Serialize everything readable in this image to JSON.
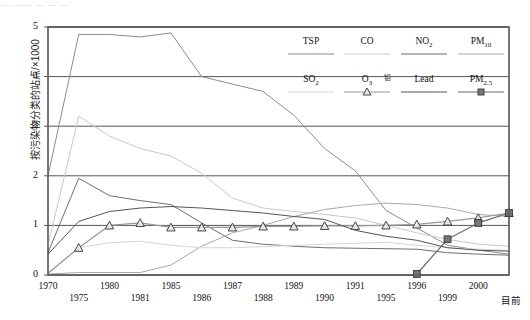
{
  "page": {
    "faint_header": "— —— — —  —",
    "axis_end_label": "目前"
  },
  "chart_data": {
    "type": "line",
    "title": "",
    "xlabel": "",
    "ylabel": "按污染物分类的站点/×1000",
    "ylim": [
      0,
      5
    ],
    "yticks": [
      "0",
      "1",
      "2",
      "3",
      "4",
      "5"
    ],
    "grid": true,
    "legend_position": "top-right",
    "categories": [
      "1970",
      "1975",
      "1980",
      "1981",
      "1985",
      "1986",
      "1987",
      "1988",
      "1989",
      "1990",
      "1991",
      "1995",
      "1996",
      "1999",
      "2000",
      "目前"
    ],
    "series": [
      {
        "name": "TSP",
        "color": "#8c8c8c",
        "marker": "none",
        "values": [
          2.0,
          4.85,
          4.85,
          4.8,
          4.88,
          4.0,
          3.85,
          3.7,
          3.22,
          2.55,
          2.1,
          1.3,
          0.95,
          0.6,
          0.5,
          0.42
        ]
      },
      {
        "name": "CO",
        "color": "#c9c9c9",
        "marker": "none",
        "values": [
          0.6,
          3.2,
          2.8,
          2.55,
          2.4,
          2.05,
          1.55,
          1.35,
          1.28,
          1.22,
          1.15,
          1.0,
          0.85,
          0.72,
          0.62,
          0.58
        ]
      },
      {
        "name": "NO2",
        "color": "#6e6e6e",
        "marker": "none",
        "values": [
          0.45,
          1.95,
          1.6,
          1.5,
          1.42,
          1.05,
          0.7,
          0.62,
          0.58,
          0.55,
          0.54,
          0.53,
          0.52,
          0.45,
          0.42,
          0.4
        ]
      },
      {
        "name": "PM10",
        "color": "#a8a8a8",
        "marker": "none",
        "values": [
          0.02,
          0.05,
          0.05,
          0.05,
          0.2,
          0.58,
          0.85,
          1.0,
          1.18,
          1.32,
          1.4,
          1.45,
          1.42,
          1.35,
          1.22,
          1.18
        ]
      },
      {
        "name": "SO2",
        "color": "#d6d6d6",
        "marker": "none",
        "values": [
          0.05,
          0.55,
          0.65,
          0.68,
          0.6,
          0.55,
          0.55,
          0.57,
          0.6,
          0.62,
          0.64,
          0.66,
          0.6,
          0.55,
          0.52,
          0.5
        ]
      },
      {
        "name": "O3",
        "color": "#9a9a9a",
        "marker": "triangle",
        "values": [
          0.03,
          0.55,
          1.0,
          1.05,
          0.96,
          0.96,
          0.96,
          0.98,
          0.98,
          0.99,
          0.99,
          1.0,
          1.02,
          1.08,
          1.15,
          1.25
        ]
      },
      {
        "name": "Lead",
        "cn_name": "铅",
        "color": "#555555",
        "marker": "none",
        "values": [
          0.42,
          1.08,
          1.28,
          1.35,
          1.38,
          1.35,
          1.3,
          1.25,
          1.18,
          1.12,
          0.9,
          0.78,
          0.7,
          0.55,
          0.5,
          0.48
        ]
      },
      {
        "name": "PM2.5",
        "color": "#6b6b6b",
        "marker": "square",
        "values": [
          null,
          null,
          null,
          null,
          null,
          null,
          null,
          null,
          null,
          null,
          null,
          null,
          0.02,
          0.72,
          1.05,
          1.25
        ]
      }
    ]
  },
  "legend": {
    "row1": [
      {
        "label": "TSP",
        "sub": "",
        "color": "#8c8c8c",
        "marker": "none"
      },
      {
        "label": "CO",
        "sub": "",
        "color": "#c9c9c9",
        "marker": "none"
      },
      {
        "label": "NO",
        "sub": "2",
        "color": "#6e6e6e",
        "marker": "none"
      },
      {
        "label": "PM",
        "sub": "10",
        "color": "#a8a8a8",
        "marker": "none"
      }
    ],
    "row2": [
      {
        "label": "SO",
        "sub": "2",
        "color": "#d6d6d6",
        "marker": "none"
      },
      {
        "label": "O",
        "sub": "3",
        "color": "#9a9a9a",
        "marker": "triangle"
      },
      {
        "label": "Lead",
        "sub": "",
        "cn": "铅",
        "color": "#555555",
        "marker": "none"
      },
      {
        "label": "PM",
        "sub": "2.5",
        "color": "#6b6b6b",
        "marker": "square"
      }
    ]
  }
}
